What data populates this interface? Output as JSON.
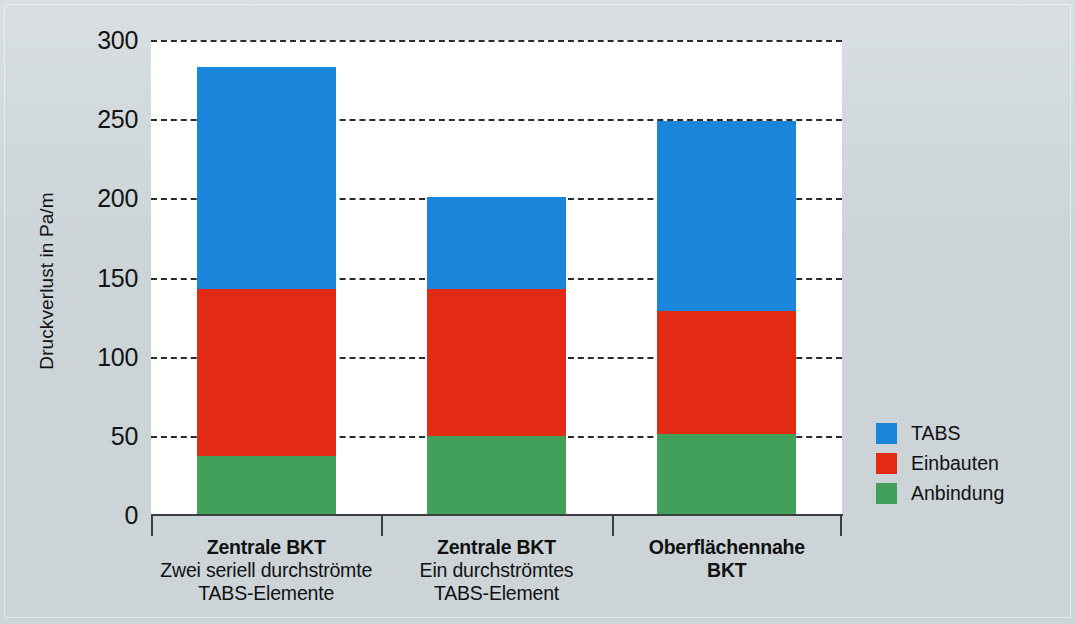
{
  "chart_data": {
    "type": "bar",
    "stacked": true,
    "title": "",
    "xlabel": "",
    "ylabel": "Druckverlust in Pa/m",
    "ylim": [
      0,
      300
    ],
    "yticks": [
      300,
      250,
      200,
      150,
      100,
      50,
      0
    ],
    "ytick_labels": [
      "300",
      "250",
      "200",
      "150",
      "100",
      "50",
      "0"
    ],
    "grid": "horizontal-dashed",
    "legend_position": "right",
    "categories": [
      "Zentrale BKT Zwei seriell durchströmte TABS-Elemente",
      "Zentrale BKT Ein durchströmtes TABS-Element",
      "Oberflächennahe BKT"
    ],
    "series": [
      {
        "name": "TABS",
        "color": "#1a86db",
        "values": [
          140,
          58,
          120
        ]
      },
      {
        "name": "Einbauten",
        "color": "#e32b14",
        "values": [
          106,
          93,
          78
        ]
      },
      {
        "name": "Anbindung",
        "color": "#41a05a",
        "values": [
          37,
          50,
          51
        ]
      }
    ],
    "totals": [
      283,
      201,
      249
    ]
  },
  "axes": {
    "y_title": "Druckverlust in Pa/m",
    "y_ticks": [
      {
        "label": "300",
        "value": 300
      },
      {
        "label": "250",
        "value": 250
      },
      {
        "label": "200",
        "value": 200
      },
      {
        "label": "150",
        "value": 150
      },
      {
        "label": "100",
        "value": 100
      },
      {
        "label": "50",
        "value": 50
      },
      {
        "label": "0",
        "value": 0
      }
    ]
  },
  "categories": [
    {
      "line1": "Zentrale BKT",
      "line2": "Zwei seriell durchströmte",
      "line3": "TABS-Elemente",
      "all_bold": false
    },
    {
      "line1": "Zentrale BKT",
      "line2": "Ein durchströmtes",
      "line3": "TABS-Element",
      "all_bold": false
    },
    {
      "line1": "Oberflächennahe",
      "line2": "BKT",
      "line3": "",
      "all_bold": true
    }
  ],
  "legend": {
    "items": [
      {
        "label": "TABS",
        "color": "#1a86db"
      },
      {
        "label": "Einbauten",
        "color": "#e32b14"
      },
      {
        "label": "Anbindung",
        "color": "#41a05a"
      }
    ]
  },
  "colors": {
    "background": "#ccd4d8",
    "plot_background": "#ffffff",
    "axis": "#3b3f42",
    "grid": "#2b2b2b",
    "tabs": "#1a86db",
    "einbauten": "#e32b14",
    "anbindung": "#41a05a"
  }
}
